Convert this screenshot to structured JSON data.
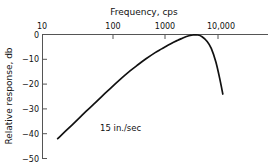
{
  "chart_data": {
    "type": "line",
    "title": "Frequency, cps",
    "xlabel": "Frequency, cps",
    "ylabel": "Relative response, db",
    "xscale": "log",
    "xlim": [
      10,
      40000
    ],
    "ylim": [
      -50,
      2
    ],
    "grid": false,
    "legend": null,
    "xticks": [
      {
        "value": 10,
        "label": "10"
      },
      {
        "value": 100,
        "label": "100"
      },
      {
        "value": 1000,
        "label": "1000"
      },
      {
        "value": 10000,
        "label": "10,000"
      }
    ],
    "yticks": [
      {
        "value": 0,
        "label": "0"
      },
      {
        "value": -10,
        "label": "−10"
      },
      {
        "value": -20,
        "label": "−20"
      },
      {
        "value": -30,
        "label": "−30"
      },
      {
        "value": -40,
        "label": "−40"
      },
      {
        "value": -50,
        "label": "−50"
      }
    ],
    "annotations": [
      {
        "text": "15 in./sec",
        "x": 400,
        "y": -38
      }
    ],
    "series": [
      {
        "name": "15 in./sec response",
        "x": [
          20,
          30,
          50,
          70,
          100,
          150,
          200,
          300,
          500,
          700,
          1000,
          1500,
          2000,
          3000,
          4000,
          5000,
          6000,
          7000,
          8000,
          10000,
          12000,
          15000,
          18000,
          22000,
          26000,
          30000
        ],
        "y": [
          -42.0,
          -38.5,
          -34.0,
          -31.0,
          -28.0,
          -24.4,
          -22.0,
          -18.6,
          -14.6,
          -12.2,
          -9.8,
          -7.3,
          -5.8,
          -3.7,
          -2.4,
          -1.5,
          -0.8,
          -0.4,
          -0.2,
          -0.2,
          -0.9,
          -2.8,
          -5.6,
          -11.0,
          -17.5,
          -24.0
        ]
      }
    ],
    "colors": {
      "curve": "#111111",
      "axis": "#555555",
      "text": "#111111",
      "background": "#ffffff"
    }
  }
}
